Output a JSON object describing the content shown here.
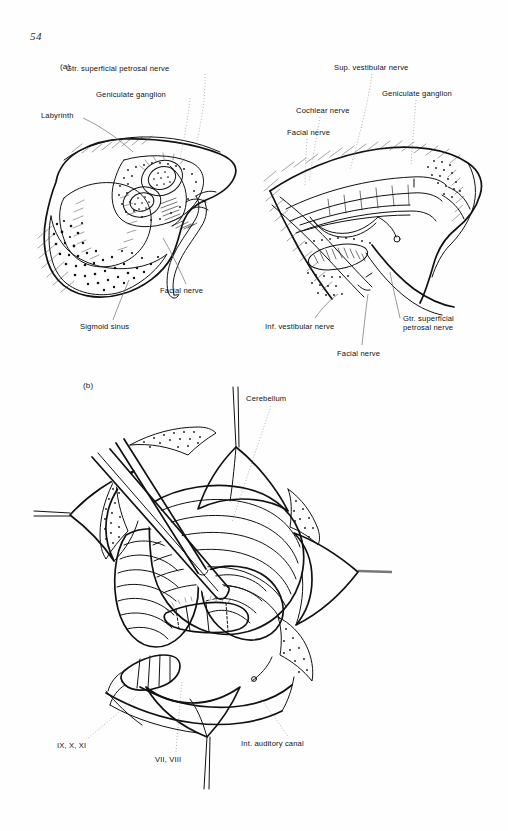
{
  "page": {
    "folio": "54",
    "background_color": "#ffffff",
    "ink_color": "#111111",
    "leader_color": "#8d8d8d"
  },
  "panels": [
    {
      "tag": "(a)",
      "description": "Two line-drawing views of the temporal bone: translabyrinthine exposure (left) and opened internal auditory canal (right)",
      "figures": [
        {
          "name": "translabyrinthine-view",
          "labels": [
            "Gtr. superficial petrosal nerve",
            "Geniculate ganglion",
            "Labyrinth",
            "Facial nerve",
            "Sigmoid sinus"
          ]
        },
        {
          "name": "internal-auditory-canal-view",
          "labels": [
            "Sup. vestibular nerve",
            "Geniculate ganglion",
            "Cochlear nerve",
            "Facial nerve",
            "Inf. vestibular nerve",
            "Gtr. superficial\npetrosal nerve",
            "Facial nerve"
          ]
        }
      ]
    },
    {
      "tag": "(b)",
      "description": "Retrosigmoid / suboccipital exposure of the cerebellopontine angle with dural flaps retracted by sutures",
      "figures": [
        {
          "name": "posterior-fossa-exposure",
          "labels": [
            "Cerebellum",
            "IX, X, XI",
            "VII, VIII",
            "Int. auditory canal"
          ]
        }
      ]
    }
  ],
  "labels_a_left": {
    "gspn": "Gtr. superficial petrosal nerve",
    "geniculate": "Geniculate ganglion",
    "labyrinth": "Labyrinth",
    "facial": "Facial nerve",
    "sigmoid": "Sigmoid sinus"
  },
  "labels_a_right": {
    "sup_vest": "Sup. vestibular nerve",
    "geniculate": "Geniculate ganglion",
    "cochlear": "Cochlear nerve",
    "facial_top": "Facial nerve",
    "inf_vest": "Inf. vestibular nerve",
    "gspn": "Gtr. superficial\npetrosal nerve",
    "facial_bottom": "Facial nerve"
  },
  "labels_b": {
    "cerebellum": "Cerebellum",
    "lower_nerves": "IX, X, XI",
    "seventh_eighth": "VII, VIII",
    "iac": "Int. auditory canal"
  },
  "tags": {
    "a": "(a)",
    "b": "(b)"
  }
}
